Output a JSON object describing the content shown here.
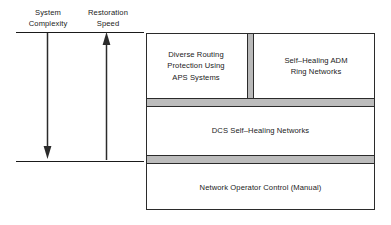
{
  "diagram": {
    "background_color": "#ffffff",
    "line_color": "#2b2b2b",
    "band_color": "#bcbcbc",
    "divider_color": "#b9b9b9"
  },
  "axes": {
    "complexity": {
      "label": "System\nComplexity",
      "direction": "down",
      "arrow_name": "downward-arrow"
    },
    "restoration": {
      "label": "Restoration\nSpeed",
      "direction": "up",
      "arrow_name": "upward-arrow"
    }
  },
  "hierarchy": {
    "tiers": [
      {
        "id": "tier-aps-adm",
        "cells": [
          {
            "id": "cell-aps",
            "label": "Diverse Routing\nProtection Using\nAPS Systems"
          },
          {
            "id": "cell-adm",
            "label": "Self–Healing ADM\nRing Networks"
          }
        ]
      },
      {
        "id": "tier-dcs",
        "label": "DCS Self–Healing Networks"
      },
      {
        "id": "tier-operator",
        "label": "Network Operator Control (Manual)"
      }
    ],
    "separators": [
      {
        "id": "band-upper",
        "kind": "gray-band"
      },
      {
        "id": "band-lower",
        "kind": "gray-band"
      }
    ]
  }
}
